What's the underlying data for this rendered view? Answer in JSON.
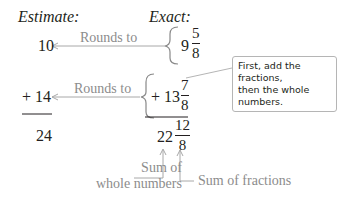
{
  "headers": {
    "estimate": "Estimate:",
    "exact": "Exact:"
  },
  "rows": [
    {
      "estimate": "10",
      "arrow_label": "Rounds to",
      "whole": "9",
      "numerator": "5",
      "denominator": "8"
    },
    {
      "estimate": "+ 14",
      "arrow_label": "Rounds to",
      "whole": "+ 13",
      "numerator": "7",
      "denominator": "8"
    }
  ],
  "totals": {
    "estimate": "24",
    "whole": "22",
    "numerator": "12",
    "denominator": "8"
  },
  "callout": {
    "line1": "First, add the fractions,",
    "line2": "then the whole numbers."
  },
  "labels": {
    "sum_whole_line1": "Sum of",
    "sum_whole_line2": "whole numbers",
    "sum_fractions": "Sum of fractions"
  },
  "colors": {
    "text": "#231f20",
    "annotation": "#8c8c8c",
    "line": "#a8a8a8"
  }
}
